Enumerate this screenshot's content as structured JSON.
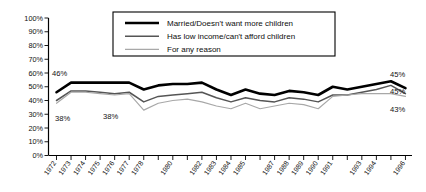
{
  "chart_data": {
    "type": "line",
    "title": "",
    "subtitle": "",
    "xlabel": "",
    "ylabel": "",
    "ylim": [
      0,
      100
    ],
    "grid": false,
    "legend_position": "top-center",
    "y_tick_labels": [
      "100%",
      "90%",
      "80%",
      "70%",
      "60%",
      "50%",
      "40%",
      "30%",
      "20%",
      "10%",
      "0%"
    ],
    "y_tick_values": [
      100,
      90,
      80,
      70,
      60,
      50,
      40,
      30,
      20,
      10,
      0
    ],
    "categories": [
      "1972",
      "1973",
      "1974",
      "1975",
      "1976",
      "1977",
      "1978",
      "1979",
      "1980",
      "1981",
      "1982",
      "1983",
      "1984",
      "1985",
      "1986",
      "1987",
      "1988",
      "1989",
      "1990",
      "1991",
      "1992",
      "1993",
      "1994",
      "1995",
      "1996"
    ],
    "x_tick_labels_shown": [
      "1972",
      "1973",
      "1974",
      "1975",
      "1976",
      "1977",
      "1978",
      "",
      "1980",
      "",
      "1982",
      "1983",
      "1984",
      "1985",
      "",
      "1987",
      "1988",
      "1989",
      "1990",
      "1991",
      "",
      "1993",
      "1994",
      "",
      "1996"
    ],
    "series": [
      {
        "name": "Married/Doesn't want more children",
        "color": "#000000",
        "width": 2.6,
        "style": "solid",
        "values": [
          46,
          53,
          53,
          53,
          53,
          53,
          48,
          51,
          52,
          52,
          53,
          48,
          44,
          48,
          45,
          44,
          47,
          46,
          44,
          50,
          48,
          50,
          52,
          54,
          49
        ]
      },
      {
        "name": "Has low income/can't afford children",
        "color": "#555555",
        "width": 1.5,
        "style": "solid",
        "values": [
          40,
          47,
          47,
          46,
          45,
          46,
          39,
          43,
          44,
          45,
          46,
          42,
          39,
          42,
          40,
          39,
          42,
          41,
          39,
          44,
          44,
          46,
          48,
          51,
          45
        ]
      },
      {
        "name": "For any reason",
        "color": "#a8a8a8",
        "width": 1.2,
        "style": "solid",
        "values": [
          38,
          46,
          46,
          45,
          44,
          45,
          33,
          38,
          40,
          41,
          39,
          36,
          34,
          38,
          34,
          36,
          38,
          37,
          34,
          43,
          44,
          45,
          45,
          45,
          43
        ]
      }
    ],
    "annotations": [
      {
        "id": "left-top",
        "text": "46%",
        "series": "Married/Doesn't want more children",
        "value": 46,
        "at": "1972",
        "side": "left"
      },
      {
        "id": "left-bottom-a",
        "text": "38%",
        "series": "For any reason",
        "value": 38,
        "at": "1972",
        "side": "left"
      },
      {
        "id": "left-bottom-b",
        "text": "38%",
        "series": "For any reason",
        "value": 38,
        "at": "1976",
        "side": "left"
      },
      {
        "id": "right-top",
        "text": "45%",
        "series": "Married/Doesn't want more children",
        "value": 45,
        "at": "1996",
        "side": "right"
      },
      {
        "id": "right-mid",
        "text": "45%",
        "series": "Has low income/can't afford children",
        "value": 45,
        "at": "1996",
        "side": "right"
      },
      {
        "id": "right-bottom",
        "text": "43%",
        "series": "For any reason",
        "value": 43,
        "at": "1996",
        "side": "right"
      }
    ]
  },
  "legend": {
    "items": [
      {
        "label": "Married/Doesn't want more children",
        "color": "#000000"
      },
      {
        "label": "Has low income/can't afford children",
        "color": "#555555"
      },
      {
        "label": "For any reason",
        "color": "#a8a8a8"
      }
    ]
  }
}
